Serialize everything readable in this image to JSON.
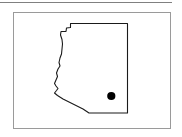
{
  "figure": {
    "type": "map-outline-figure",
    "caption": "",
    "frame": {
      "border_color": "#9a9a9a",
      "background_color": "#ffffff",
      "x": 13,
      "y": 12,
      "width": 158,
      "height": 117
    },
    "top_rule": {
      "color": "#808080",
      "x": 0,
      "y": 2,
      "width": 172,
      "height": 1
    }
  },
  "map": {
    "region_name": "Arizona",
    "outline_color": "#1a1a1a",
    "outline_width": 1.1,
    "fill_color": "#ffffff",
    "outline_path": "M 70.5,23.5 L 127.5,23.5 L 127.5,113.0 L 89.0,113.0 L 83.0,109.0 L 74.0,104.5 L 63.0,99.0 L 57.5,95.5 L 54.5,93.0 L 56.5,90.5 L 58.0,88.5 L 56.0,86.0 L 54.5,83.5 L 56.0,80.0 L 57.5,76.5 L 56.5,73.0 L 58.0,69.0 L 60.0,66.0 L 59.0,62.5 L 60.0,58.0 L 61.5,54.0 L 62.0,49.0 L 62.5,44.0 L 62.0,39.5 L 60.5,35.0 L 61.0,31.5 L 66.0,31.5 L 66.5,28.0 L 70.5,27.5 Z",
    "markers": [
      {
        "name": "city-marker",
        "label": "",
        "x": 111.3,
        "y": 96.0,
        "radius": 4.1,
        "color": "#000000"
      }
    ]
  }
}
